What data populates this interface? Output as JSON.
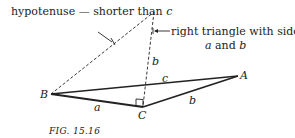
{
  "figure": {
    "caption": "FIG. 15.16",
    "colors": {
      "ink": "#222222",
      "background": "#ffffff"
    },
    "annotations": {
      "hypotenuse_prefix": "hypotenuse — shorter than ",
      "hypotenuse_var": "c",
      "right_triangle_line1": "right triangle with sides",
      "right_triangle_var_a": "a",
      "right_triangle_and": " and ",
      "right_triangle_var_b": "b"
    },
    "vertices": {
      "A": "A",
      "B": "B",
      "C": "C"
    },
    "side_labels": {
      "a": "a",
      "b_bottom": "b",
      "b_vertical": "b",
      "c": "c"
    }
  }
}
